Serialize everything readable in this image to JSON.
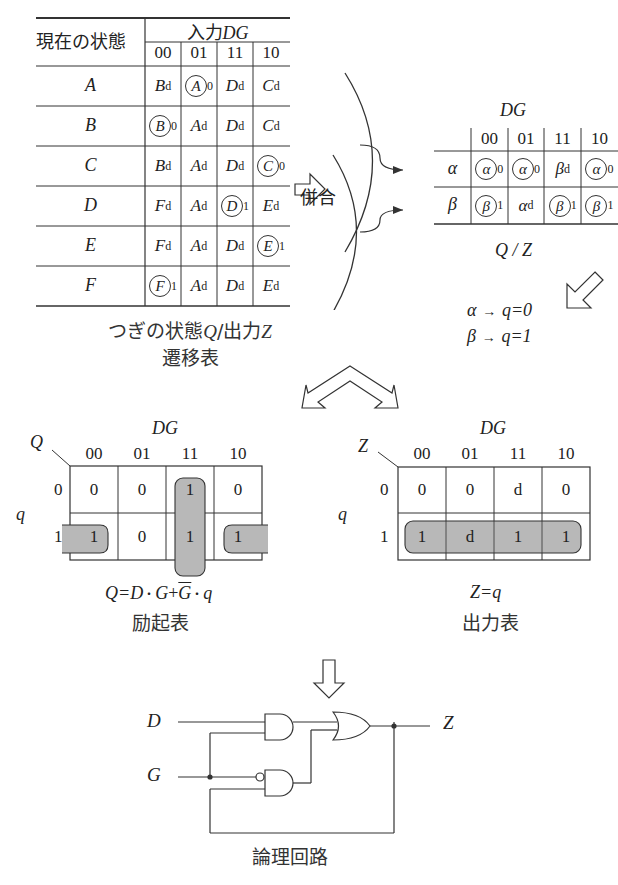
{
  "transition_table": {
    "row_header": "現在の状態",
    "input_header": "入力",
    "input_var": "DG",
    "columns": [
      "00",
      "01",
      "11",
      "10"
    ],
    "rows": [
      {
        "state": "A",
        "cells": [
          {
            "s": "B",
            "sub": "d",
            "circled": false
          },
          {
            "s": "A",
            "sub": "0",
            "circled": true
          },
          {
            "s": "D",
            "sub": "d",
            "circled": false
          },
          {
            "s": "C",
            "sub": "d",
            "circled": false
          }
        ]
      },
      {
        "state": "B",
        "cells": [
          {
            "s": "B",
            "sub": "0",
            "circled": true
          },
          {
            "s": "A",
            "sub": "d",
            "circled": false
          },
          {
            "s": "D",
            "sub": "d",
            "circled": false
          },
          {
            "s": "C",
            "sub": "d",
            "circled": false
          }
        ]
      },
      {
        "state": "C",
        "cells": [
          {
            "s": "B",
            "sub": "d",
            "circled": false
          },
          {
            "s": "A",
            "sub": "d",
            "circled": false
          },
          {
            "s": "D",
            "sub": "d",
            "circled": false
          },
          {
            "s": "C",
            "sub": "0",
            "circled": true
          }
        ]
      },
      {
        "state": "D",
        "cells": [
          {
            "s": "F",
            "sub": "d",
            "circled": false
          },
          {
            "s": "A",
            "sub": "d",
            "circled": false
          },
          {
            "s": "D",
            "sub": "1",
            "circled": true
          },
          {
            "s": "E",
            "sub": "d",
            "circled": false
          }
        ]
      },
      {
        "state": "E",
        "cells": [
          {
            "s": "F",
            "sub": "d",
            "circled": false
          },
          {
            "s": "A",
            "sub": "d",
            "circled": false
          },
          {
            "s": "D",
            "sub": "d",
            "circled": false
          },
          {
            "s": "E",
            "sub": "1",
            "circled": true
          }
        ]
      },
      {
        "state": "F",
        "cells": [
          {
            "s": "F",
            "sub": "1",
            "circled": true
          },
          {
            "s": "A",
            "sub": "d",
            "circled": false
          },
          {
            "s": "D",
            "sub": "d",
            "circled": false
          },
          {
            "s": "E",
            "sub": "d",
            "circled": false
          }
        ]
      }
    ],
    "caption_line1_prefix": "つぎの状態",
    "caption_line1_q": "Q",
    "caption_line1_slash": "/",
    "caption_line1_out": "出力",
    "caption_line1_z": "Z",
    "caption_line2": "遷移表"
  },
  "merge_label": "併合",
  "merged_table": {
    "title": "DG",
    "columns": [
      "00",
      "01",
      "11",
      "10"
    ],
    "rows": [
      {
        "state": "α",
        "cells": [
          {
            "s": "α",
            "sub": "0",
            "circled": true
          },
          {
            "s": "α",
            "sub": "0",
            "circled": true
          },
          {
            "s": "β",
            "sub": "d",
            "circled": false
          },
          {
            "s": "α",
            "sub": "0",
            "circled": true
          }
        ]
      },
      {
        "state": "β",
        "cells": [
          {
            "s": "β",
            "sub": "1",
            "circled": true
          },
          {
            "s": "α",
            "sub": "d",
            "circled": false
          },
          {
            "s": "β",
            "sub": "1",
            "circled": true
          },
          {
            "s": "β",
            "sub": "1",
            "circled": true
          }
        ]
      }
    ],
    "caption": "Q / Z"
  },
  "assignment": [
    {
      "state": "α",
      "arrow": "→",
      "expr": "q=0"
    },
    {
      "state": "β",
      "arrow": "→",
      "expr": "q=1"
    }
  ],
  "excitation_map": {
    "title": "DG",
    "corner_out": "Q",
    "row_var": "q",
    "columns": [
      "00",
      "01",
      "11",
      "10"
    ],
    "row_labels": [
      "0",
      "1"
    ],
    "values": [
      [
        "0",
        "0",
        "1",
        "0"
      ],
      [
        "1",
        "0",
        "1",
        "1"
      ]
    ],
    "equation": "Q=D・G+G・q",
    "equation_parts": {
      "lhs": "Q=D",
      "dot1": "・",
      "g": "G",
      "plus": "+",
      "gbar": "G",
      "dot2": "・",
      "q": "q"
    },
    "caption": "励起表"
  },
  "output_map": {
    "title": "DG",
    "corner_out": "Z",
    "row_var": "q",
    "columns": [
      "00",
      "01",
      "11",
      "10"
    ],
    "row_labels": [
      "0",
      "1"
    ],
    "values": [
      [
        "0",
        "0",
        "d",
        "0"
      ],
      [
        "1",
        "d",
        "1",
        "1"
      ]
    ],
    "equation": "Z=q",
    "caption": "出力表"
  },
  "circuit": {
    "inputs": [
      "D",
      "G"
    ],
    "output": "Z",
    "caption": "論理回路"
  },
  "colors": {
    "line": "#333333",
    "shade": "#b8b8b8",
    "background": "#ffffff"
  }
}
